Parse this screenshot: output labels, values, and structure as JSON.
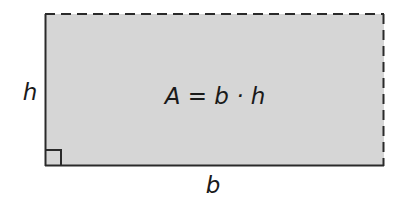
{
  "diagram": {
    "formula": "A = b · h",
    "labels": {
      "height": "h",
      "base": "b"
    },
    "colors": {
      "fill": "#d6d6d6",
      "stroke": "#2a2a2a",
      "background": "#ffffff"
    },
    "edges": {
      "left": "solid",
      "bottom": "solid",
      "top": "dashed",
      "right": "dashed"
    },
    "right_angle_marker": "bottom-left"
  }
}
